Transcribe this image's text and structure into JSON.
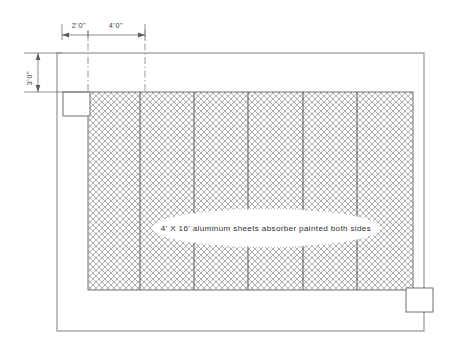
{
  "drawing": {
    "title": "Solar absorber panel elevation",
    "colors": {
      "line": "#6f6f6f",
      "frame": "#8a8a8a",
      "mesh": "#9a9a9a",
      "text": "#3a3a3a",
      "background": "#ffffff"
    },
    "dimensions": [
      {
        "name": "bay-left-offset",
        "label": "2'0\"",
        "x": 79,
        "y": 28
      },
      {
        "name": "bay-module-width",
        "label": "4'0\"",
        "x": 112,
        "y": 28
      },
      {
        "name": "top-margin-height",
        "label": "3'0\"",
        "x": 32,
        "y": 78
      }
    ],
    "callout": {
      "label": "4' X 16' aluminum sheets absorber painted both sides",
      "cx": 266,
      "cy": 228,
      "rx": 114,
      "ry": 19
    },
    "panel": {
      "name": "absorber-mesh-panel",
      "x": 88,
      "y": 92,
      "width": 325,
      "height": 198,
      "bay_dividers": [
        140,
        194,
        248,
        303,
        357
      ]
    },
    "frame": {
      "name": "outer-enclosure-frame",
      "x": 57,
      "y": 53,
      "width": 367,
      "height": 278
    },
    "detail_boxes": [
      {
        "name": "detail-box-upper-left",
        "x": 63,
        "y": 92,
        "width": 27,
        "height": 24
      },
      {
        "name": "detail-box-lower-right",
        "x": 406,
        "y": 288,
        "width": 27,
        "height": 24
      }
    ],
    "centerlines": [
      {
        "name": "centerline-left",
        "x": 88
      },
      {
        "name": "centerline-bay",
        "x": 145
      }
    ]
  }
}
